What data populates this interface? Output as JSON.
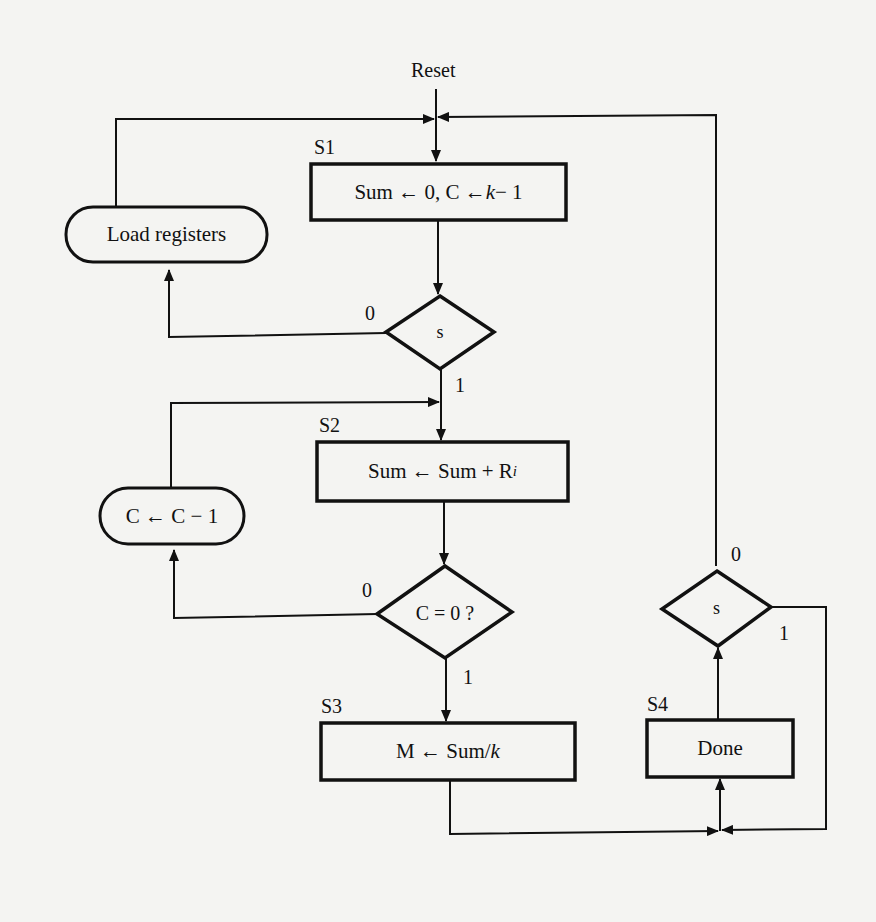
{
  "diagram": {
    "type": "ASM chart / flowchart",
    "entry": {
      "label": "Reset"
    },
    "states": [
      {
        "id": "S1",
        "name": "S1",
        "action_parts": [
          "Sum ← 0, C ← ",
          "k",
          " − 1"
        ]
      },
      {
        "id": "S2",
        "name": "S2",
        "action_parts": [
          "Sum ← Sum + R",
          "i"
        ]
      },
      {
        "id": "S3",
        "name": "S3",
        "action_parts": [
          "M ← Sum/",
          "k"
        ]
      },
      {
        "id": "S4",
        "name": "S4",
        "action": "Done"
      }
    ],
    "conditional_outputs": [
      {
        "id": "load",
        "text": "Load registers"
      },
      {
        "id": "dec",
        "text": "C ← C − 1"
      }
    ],
    "decisions": [
      {
        "id": "d1",
        "text": "s",
        "branch_0": "0",
        "branch_1": "1"
      },
      {
        "id": "d2",
        "text": "C = 0 ?",
        "branch_0": "0",
        "branch_1": "1"
      },
      {
        "id": "d3",
        "text": "s",
        "branch_0": "0",
        "branch_1": "1"
      }
    ],
    "colors": {
      "ink": "#111111",
      "paper": "#f4f4f2"
    }
  }
}
